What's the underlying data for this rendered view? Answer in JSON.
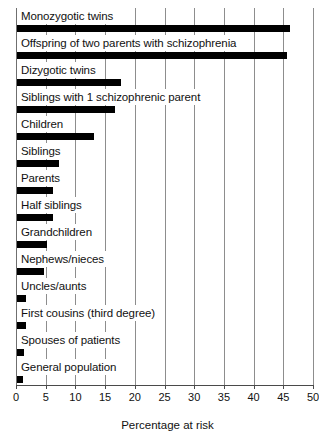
{
  "chart_data": {
    "type": "bar",
    "orientation": "horizontal",
    "title": "",
    "xlabel": "Percentage at risk",
    "ylabel": "",
    "xlim": [
      0,
      50
    ],
    "xticks": [
      0,
      5,
      10,
      15,
      20,
      25,
      30,
      35,
      40,
      45,
      50
    ],
    "xtick_labels": [
      "0",
      "5",
      "10",
      "15",
      "20",
      "25",
      "30",
      "35",
      "40",
      "45",
      "50"
    ],
    "grid": true,
    "legend": false,
    "bar_color": "#000000",
    "background_color": "#ffffff",
    "categories": [
      "Monozygotic twins",
      "Offspring of two parents with schizophrenia",
      "Dizygotic twins",
      "Siblings with 1 schizophrenic parent",
      "Children",
      "Siblings",
      "Parents",
      "Half siblings",
      "Grandchildren",
      "Nephews/nieces",
      "Uncles/aunts",
      "First cousins (third degree)",
      "Spouses of patients",
      "General population"
    ],
    "values": [
      46,
      45.5,
      17.5,
      16.5,
      13,
      7,
      6,
      6,
      5,
      4.5,
      1.5,
      1.5,
      1.2,
      1
    ]
  }
}
